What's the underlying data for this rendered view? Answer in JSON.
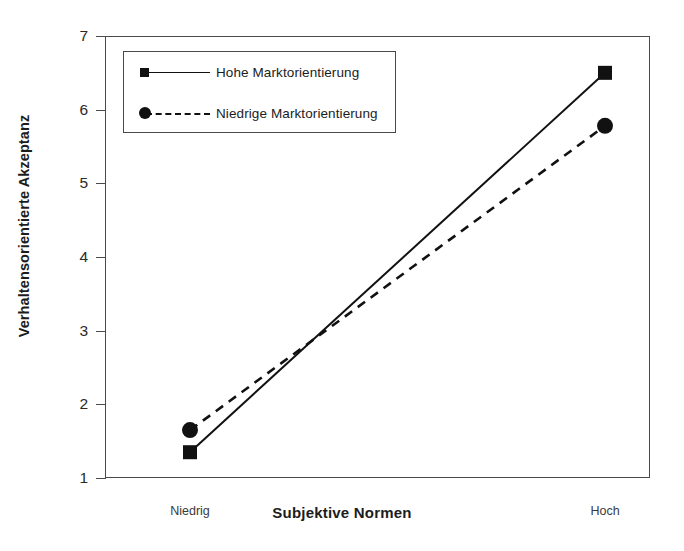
{
  "chart_data": {
    "type": "line",
    "title": "",
    "xlabel": "Subjektive Normen",
    "ylabel": "Verhaltensorientierte Akzeptanz",
    "categories": [
      "Niedrig",
      "Hoch"
    ],
    "ylim": [
      1,
      7
    ],
    "yticks": [
      1,
      2,
      3,
      4,
      5,
      6,
      7
    ],
    "ytick_labels": [
      "1",
      "2",
      "3",
      "4",
      "5",
      "6",
      "7"
    ],
    "grid": false,
    "legend_position": "upper left inside",
    "series": [
      {
        "name": "Hohe Marktorientierung",
        "values": [
          1.35,
          6.5
        ],
        "linestyle": "solid",
        "marker": "square",
        "color": "#111111"
      },
      {
        "name": "Niedrige Marktorientierung",
        "values": [
          1.65,
          5.78
        ],
        "linestyle": "dashed",
        "marker": "circle",
        "color": "#111111"
      }
    ]
  },
  "legend": {
    "items": [
      {
        "label": "Hohe Marktorientierung"
      },
      {
        "label": "Niedrige Marktorientierung"
      }
    ]
  },
  "axes": {
    "y": {
      "label": "Verhaltensorientierte Akzeptanz",
      "ticks": [
        "7",
        "6",
        "5",
        "4",
        "3",
        "2",
        "1"
      ]
    },
    "x": {
      "title": "Subjektive Normen",
      "categories": [
        "Niedrig",
        "Hoch"
      ]
    }
  },
  "colors": {
    "line": "#111111",
    "frame": "#4a4a4a",
    "text": "#1c1c1c",
    "background": "#ffffff"
  }
}
